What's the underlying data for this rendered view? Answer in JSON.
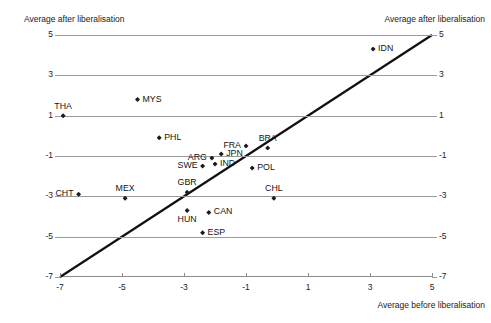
{
  "chart_data": {
    "type": "scatter",
    "title": "",
    "xlabel": "Average before liberalisation",
    "ylabel_left": "Average after liberalisation",
    "ylabel_right": "Average after liberalisation",
    "xlim": [
      -7,
      5
    ],
    "ylim": [
      -7,
      5
    ],
    "xticks": [
      -7,
      -5,
      -3,
      -1,
      1,
      3,
      5
    ],
    "xticklabels": [
      "-7",
      "-5",
      "-3",
      "-1",
      "1",
      "3",
      "5"
    ],
    "yticks": [
      5,
      3,
      1,
      -1,
      -3,
      -5,
      -7
    ],
    "yticklabels_left": [
      "5",
      "3",
      "1",
      "-1",
      "-3",
      "-5",
      "-7"
    ],
    "yticklabels_right": [
      "5",
      "3",
      "1",
      "-1",
      "-3",
      "-5",
      "-7"
    ],
    "grid": "horizontal",
    "legend": "none",
    "reference_line": {
      "label": "45-degree line",
      "from": [
        -7,
        -7
      ],
      "to": [
        5,
        5
      ]
    },
    "marker_shape": "diamond",
    "marker_color": "#1b1b1b",
    "points": [
      {
        "label": "IDN",
        "x": 3.1,
        "y": 4.3,
        "label_pos": "right"
      },
      {
        "label": "MYS",
        "x": -4.5,
        "y": 1.8,
        "label_pos": "right"
      },
      {
        "label": "THA",
        "x": -6.9,
        "y": 1.0,
        "label_pos": "above"
      },
      {
        "label": "PHL",
        "x": -3.8,
        "y": -0.1,
        "label_pos": "right"
      },
      {
        "label": "FRA",
        "x": -1.0,
        "y": -0.5,
        "label_pos": "left"
      },
      {
        "label": "BRA",
        "x": -0.3,
        "y": -0.6,
        "label_pos": "above"
      },
      {
        "label": "ARG",
        "x": -2.1,
        "y": -1.1,
        "label_pos": "left"
      },
      {
        "label": "JPN",
        "x": -1.8,
        "y": -0.9,
        "label_pos": "right"
      },
      {
        "label": "IND",
        "x": -2.0,
        "y": -1.4,
        "label_pos": "right"
      },
      {
        "label": "SWE",
        "x": -2.4,
        "y": -1.5,
        "label_pos": "left"
      },
      {
        "label": "POL",
        "x": -0.8,
        "y": -1.6,
        "label_pos": "right"
      },
      {
        "label": "CHT",
        "x": -6.4,
        "y": -2.9,
        "label_pos": "left"
      },
      {
        "label": "MEX",
        "x": -4.9,
        "y": -3.1,
        "label_pos": "above"
      },
      {
        "label": "GBR",
        "x": -2.9,
        "y": -2.8,
        "label_pos": "above"
      },
      {
        "label": "CHL",
        "x": -0.1,
        "y": -3.1,
        "label_pos": "above"
      },
      {
        "label": "HUN",
        "x": -2.9,
        "y": -3.7,
        "label_pos": "below"
      },
      {
        "label": "CAN",
        "x": -2.2,
        "y": -3.8,
        "label_pos": "right"
      },
      {
        "label": "ESP",
        "x": -2.4,
        "y": -4.8,
        "label_pos": "right"
      }
    ]
  }
}
